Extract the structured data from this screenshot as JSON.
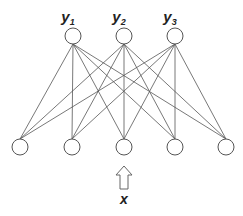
{
  "diagram": {
    "title": "",
    "output_nodes": [
      {
        "label": "y",
        "sub": "1",
        "cx": 73,
        "cy": 36
      },
      {
        "label": "y",
        "sub": "2",
        "cx": 124,
        "cy": 36
      },
      {
        "label": "y",
        "sub": "3",
        "cx": 175,
        "cy": 36
      }
    ],
    "input_nodes": [
      {
        "cx": 20,
        "cy": 147
      },
      {
        "cx": 72,
        "cy": 147
      },
      {
        "cx": 124,
        "cy": 147
      },
      {
        "cx": 175,
        "cy": 147
      },
      {
        "cx": 226,
        "cy": 147
      }
    ],
    "node_radius": 8,
    "connections": "fully-connected",
    "input_label": "x",
    "colors": {
      "stroke": "#555555",
      "text": "#222222",
      "background": "#ffffff"
    }
  }
}
